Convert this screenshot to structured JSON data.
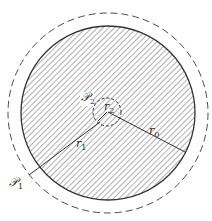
{
  "diagram": {
    "title": "",
    "center": [
      108,
      113
    ],
    "shapes": {
      "outer_dashed_circle": {
        "cx": 108,
        "cy": 113,
        "r": 100,
        "style": "dashed",
        "color": "#4a4a4a"
      },
      "body_circle": {
        "cx": 108,
        "cy": 113,
        "r": 87,
        "style": "solid",
        "fill": "hatched",
        "color": "#333333"
      },
      "inner_dashed_circle": {
        "cx": 107,
        "cy": 112,
        "r": 14,
        "style": "dashed",
        "color": "#333333"
      }
    },
    "lines": {
      "r0_line": {
        "from": [
          108,
          112
        ],
        "to": [
          185,
          152
        ]
      },
      "r1_line": {
        "from": [
          100,
          122
        ],
        "to": [
          29,
          175
        ]
      },
      "r2_line": {
        "from": [
          107,
          112
        ],
        "to": [
          98,
          121
        ]
      }
    },
    "labels": {
      "P2": {
        "base": "𝒫",
        "sub": "2"
      },
      "r2": {
        "base": "r",
        "sub": "2"
      },
      "r0": {
        "base": "r",
        "sub": "0"
      },
      "r1": {
        "base": "r",
        "sub": "1"
      },
      "P1": {
        "base": "𝒫",
        "sub": "1"
      }
    },
    "colors": {
      "ink": "#333333",
      "hatch": "#6b6b6b",
      "background": "#ffffff"
    }
  }
}
